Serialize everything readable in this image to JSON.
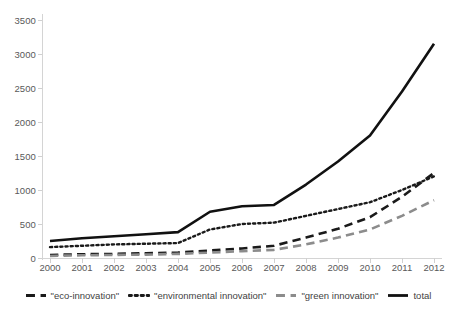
{
  "chart_data": {
    "type": "line",
    "title": "",
    "subtitle": "",
    "xlabel": "",
    "ylabel": "",
    "xlim": [
      2000,
      2012
    ],
    "ylim": [
      0,
      3500
    ],
    "grid": false,
    "legend_position": "bottom",
    "x": [
      2000,
      2001,
      2002,
      2003,
      2004,
      2005,
      2006,
      2007,
      2008,
      2009,
      2010,
      2011,
      2012
    ],
    "categories": [
      "2000",
      "2001",
      "2002",
      "2003",
      "2004",
      "2005",
      "2006",
      "2007",
      "2008",
      "2009",
      "2010",
      "2011",
      "2012"
    ],
    "y_ticks": [
      0,
      500,
      1000,
      1500,
      2000,
      2500,
      3000,
      3500
    ],
    "y_tick_labels": [
      "0",
      "500",
      "1000",
      "1500",
      "2000",
      "2500",
      "3000",
      "3500"
    ],
    "series": [
      {
        "name": "\"eco-innovation\"",
        "style": "dashed",
        "color": "#1a1a1a",
        "values": [
          45,
          55,
          60,
          70,
          80,
          110,
          140,
          180,
          300,
          430,
          600,
          900,
          1250
        ]
      },
      {
        "name": "\"environmental innovation\"",
        "style": "dotted",
        "color": "#1a1a1a",
        "values": [
          160,
          180,
          200,
          210,
          220,
          420,
          500,
          520,
          620,
          720,
          820,
          1000,
          1200
        ]
      },
      {
        "name": "\"green innovation\"",
        "style": "dashed",
        "color": "#8c8c8c",
        "values": [
          30,
          40,
          45,
          50,
          60,
          80,
          100,
          120,
          200,
          300,
          420,
          620,
          850
        ]
      },
      {
        "name": "total",
        "style": "solid",
        "color": "#111111",
        "values": [
          250,
          290,
          320,
          350,
          380,
          680,
          760,
          780,
          1080,
          1420,
          1800,
          2450,
          3150
        ]
      }
    ]
  },
  "legend": {
    "items": [
      {
        "label": "\"eco-innovation\"",
        "style": "dashed",
        "color": "#1a1a1a"
      },
      {
        "label": "\"environmental innovation\"",
        "style": "dotted",
        "color": "#1a1a1a"
      },
      {
        "label": "\"green innovation\"",
        "style": "dashed",
        "color": "#8c8c8c"
      },
      {
        "label": "total",
        "style": "solid",
        "color": "#111111"
      }
    ]
  }
}
